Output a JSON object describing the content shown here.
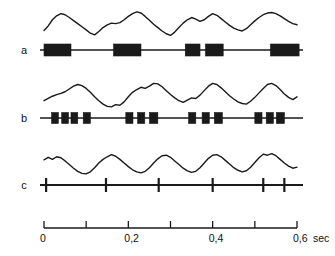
{
  "figure": {
    "title": "",
    "background_color": "#ffffff",
    "ink_color": "#1a1a1a",
    "rows": [
      {
        "id": "a",
        "label": "a",
        "marker_type": "thick-bars"
      },
      {
        "id": "b",
        "label": "b",
        "marker_type": "square-bursts"
      },
      {
        "id": "c",
        "label": "c",
        "marker_type": "tick-spikes"
      }
    ]
  },
  "axis": {
    "label_unit": "sec",
    "min": 0,
    "max": 0.6,
    "tick_step": 0.1,
    "ticks": [
      0,
      0.1,
      0.2,
      0.3,
      0.4,
      0.5,
      0.6
    ],
    "tick_labels": [
      "0",
      "",
      "0,2",
      "",
      "0,4",
      "",
      "0,6"
    ],
    "labeled_ticks": [
      {
        "value": 0,
        "text": "0"
      },
      {
        "value": 0.2,
        "text": "0,2"
      },
      {
        "value": 0.4,
        "text": "0,4"
      },
      {
        "value": 0.6,
        "text": "0,6"
      }
    ],
    "unit_suffix": "sec"
  },
  "chart_data": {
    "type": "line",
    "title": "",
    "xlabel": "sec",
    "ylabel": "",
    "xlim": [
      0,
      0.6
    ],
    "grid": false,
    "legend": "none",
    "panels": [
      {
        "name": "a",
        "label": "a",
        "trace": {
          "name": "waveform-a",
          "x": [
            0.0,
            0.01,
            0.02,
            0.03,
            0.04,
            0.05,
            0.06,
            0.07,
            0.08,
            0.09,
            0.1,
            0.11,
            0.12,
            0.13,
            0.14,
            0.15,
            0.16,
            0.17,
            0.18,
            0.19,
            0.2,
            0.21,
            0.22,
            0.23,
            0.24,
            0.25,
            0.26,
            0.27,
            0.28,
            0.29,
            0.3,
            0.31,
            0.32,
            0.33,
            0.34,
            0.35,
            0.36,
            0.37,
            0.38,
            0.39,
            0.4,
            0.41,
            0.42,
            0.43,
            0.44,
            0.45,
            0.46,
            0.47,
            0.48,
            0.49,
            0.5,
            0.51,
            0.52,
            0.53,
            0.54,
            0.55,
            0.56,
            0.57,
            0.58,
            0.59,
            0.6
          ],
          "y": [
            0.2,
            0.36,
            0.58,
            0.72,
            0.8,
            0.76,
            0.66,
            0.55,
            0.44,
            0.33,
            0.22,
            0.1,
            0.04,
            0.16,
            0.3,
            0.4,
            0.46,
            0.44,
            0.48,
            0.58,
            0.7,
            0.8,
            0.86,
            0.82,
            0.7,
            0.56,
            0.42,
            0.3,
            0.18,
            0.08,
            0.02,
            0.14,
            0.3,
            0.46,
            0.58,
            0.66,
            0.6,
            0.52,
            0.58,
            0.7,
            0.8,
            0.74,
            0.62,
            0.5,
            0.38,
            0.28,
            0.22,
            0.18,
            0.26,
            0.4,
            0.54,
            0.66,
            0.76,
            0.82,
            0.84,
            0.8,
            0.72,
            0.62,
            0.52,
            0.44,
            0.4
          ]
        },
        "events": [
          {
            "start": 0.0,
            "end": 0.064,
            "kind": "burst-bar"
          },
          {
            "start": 0.165,
            "end": 0.23,
            "kind": "burst-bar"
          },
          {
            "start": 0.335,
            "end": 0.37,
            "kind": "burst-bar"
          },
          {
            "start": 0.383,
            "end": 0.425,
            "kind": "burst-bar"
          },
          {
            "start": 0.537,
            "end": 0.605,
            "kind": "burst-bar"
          }
        ]
      },
      {
        "name": "b",
        "label": "b",
        "trace": {
          "name": "waveform-b",
          "x": [
            0.0,
            0.01,
            0.02,
            0.03,
            0.04,
            0.05,
            0.06,
            0.07,
            0.08,
            0.09,
            0.1,
            0.11,
            0.12,
            0.13,
            0.14,
            0.15,
            0.16,
            0.17,
            0.18,
            0.19,
            0.2,
            0.21,
            0.22,
            0.23,
            0.24,
            0.25,
            0.26,
            0.27,
            0.28,
            0.29,
            0.3,
            0.31,
            0.32,
            0.33,
            0.34,
            0.35,
            0.36,
            0.37,
            0.38,
            0.39,
            0.4,
            0.41,
            0.42,
            0.43,
            0.44,
            0.45,
            0.46,
            0.47,
            0.48,
            0.49,
            0.5,
            0.51,
            0.52,
            0.53,
            0.54,
            0.55,
            0.56,
            0.57,
            0.58,
            0.59,
            0.6
          ],
          "y": [
            0.26,
            0.34,
            0.42,
            0.48,
            0.52,
            0.58,
            0.68,
            0.78,
            0.84,
            0.8,
            0.7,
            0.56,
            0.4,
            0.26,
            0.14,
            0.06,
            0.04,
            0.12,
            0.1,
            0.22,
            0.4,
            0.56,
            0.66,
            0.74,
            0.7,
            0.78,
            0.88,
            0.86,
            0.76,
            0.62,
            0.48,
            0.36,
            0.26,
            0.2,
            0.28,
            0.36,
            0.34,
            0.46,
            0.62,
            0.78,
            0.88,
            0.84,
            0.72,
            0.58,
            0.44,
            0.32,
            0.22,
            0.16,
            0.14,
            0.24,
            0.38,
            0.54,
            0.7,
            0.84,
            0.88,
            0.8,
            0.66,
            0.5,
            0.38,
            0.3,
            0.4
          ]
        },
        "events": [
          {
            "start": 0.018,
            "end": 0.034,
            "kind": "square"
          },
          {
            "start": 0.042,
            "end": 0.058,
            "kind": "square"
          },
          {
            "start": 0.064,
            "end": 0.08,
            "kind": "square"
          },
          {
            "start": 0.093,
            "end": 0.11,
            "kind": "square"
          },
          {
            "start": 0.194,
            "end": 0.211,
            "kind": "square"
          },
          {
            "start": 0.222,
            "end": 0.239,
            "kind": "square"
          },
          {
            "start": 0.25,
            "end": 0.27,
            "kind": "square"
          },
          {
            "start": 0.343,
            "end": 0.36,
            "kind": "square"
          },
          {
            "start": 0.375,
            "end": 0.392,
            "kind": "square"
          },
          {
            "start": 0.404,
            "end": 0.423,
            "kind": "square"
          },
          {
            "start": 0.5,
            "end": 0.517,
            "kind": "square"
          },
          {
            "start": 0.527,
            "end": 0.544,
            "kind": "square"
          },
          {
            "start": 0.551,
            "end": 0.57,
            "kind": "square"
          }
        ]
      },
      {
        "name": "c",
        "label": "c",
        "trace": {
          "name": "waveform-c",
          "x": [
            0.0,
            0.01,
            0.02,
            0.03,
            0.04,
            0.05,
            0.06,
            0.07,
            0.08,
            0.09,
            0.1,
            0.11,
            0.12,
            0.13,
            0.14,
            0.15,
            0.16,
            0.17,
            0.18,
            0.19,
            0.2,
            0.21,
            0.22,
            0.23,
            0.24,
            0.25,
            0.26,
            0.27,
            0.28,
            0.29,
            0.3,
            0.31,
            0.32,
            0.33,
            0.34,
            0.35,
            0.36,
            0.37,
            0.38,
            0.39,
            0.4,
            0.41,
            0.42,
            0.43,
            0.44,
            0.45,
            0.46,
            0.47,
            0.48,
            0.49,
            0.5,
            0.51,
            0.52,
            0.53,
            0.54,
            0.55,
            0.56,
            0.57,
            0.58,
            0.59,
            0.6
          ],
          "y": [
            0.62,
            0.72,
            0.64,
            0.74,
            0.7,
            0.58,
            0.44,
            0.3,
            0.18,
            0.1,
            0.08,
            0.16,
            0.32,
            0.5,
            0.64,
            0.74,
            0.82,
            0.76,
            0.64,
            0.5,
            0.36,
            0.24,
            0.16,
            0.12,
            0.18,
            0.32,
            0.5,
            0.66,
            0.78,
            0.8,
            0.72,
            0.58,
            0.44,
            0.3,
            0.2,
            0.14,
            0.18,
            0.32,
            0.5,
            0.68,
            0.8,
            0.82,
            0.74,
            0.6,
            0.46,
            0.32,
            0.22,
            0.16,
            0.2,
            0.34,
            0.52,
            0.7,
            0.84,
            0.8,
            0.86,
            0.78,
            0.64,
            0.5,
            0.38,
            0.3,
            0.34
          ]
        },
        "events": [
          {
            "time": 0.005,
            "kind": "spike"
          },
          {
            "time": 0.147,
            "kind": "spike"
          },
          {
            "time": 0.272,
            "kind": "spike"
          },
          {
            "time": 0.4,
            "kind": "spike"
          },
          {
            "time": 0.52,
            "kind": "spike"
          },
          {
            "time": 0.57,
            "kind": "spike"
          }
        ]
      }
    ]
  }
}
